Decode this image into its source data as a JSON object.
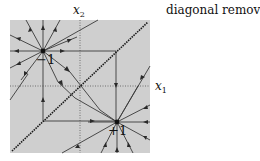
{
  "caption": "diagonal removed",
  "axes": {
    "x1": {
      "symbol": "x",
      "subscript": "1"
    },
    "x2": {
      "symbol": "x",
      "subscript": "2"
    }
  },
  "points": [
    {
      "label": "−1",
      "kind": "source",
      "x": 43,
      "y": 51
    },
    {
      "label": "+1",
      "kind": "sink",
      "x": 117,
      "y": 122
    }
  ],
  "colors": {
    "background_region": "#cfcfcf",
    "lines": "#3a3a3a",
    "diagonal": "#1a1a1a",
    "axis_dotted": "#555555"
  }
}
